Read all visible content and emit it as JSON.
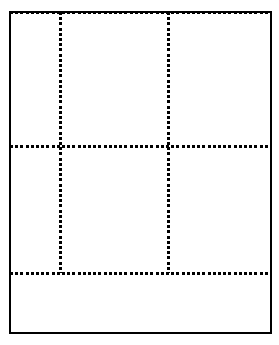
{
  "figure": {
    "kind": "dotted-grid-layout-guide",
    "width": 279,
    "height": 345,
    "background_color": "#ffffff",
    "ink_color": "#000000"
  },
  "frame": {
    "name": "outer-border",
    "style": "solid",
    "left": 9,
    "top": 11,
    "right": 270,
    "bottom": 332,
    "thickness": 2,
    "color": "#000000"
  },
  "dot_style": {
    "shape": "square",
    "size": 3,
    "spacing": 5.2,
    "color": "#000000"
  },
  "grid": {
    "columns": 3,
    "rows": 2,
    "vertical_rules": [
      {
        "name": "vertical-rule-1",
        "x": 59,
        "y_start": 12,
        "y_end": 273
      },
      {
        "name": "vertical-rule-2",
        "x": 167,
        "y_start": 12,
        "y_end": 273
      }
    ],
    "horizontal_rules": [
      {
        "name": "horizontal-rule-top-edge",
        "y": 11,
        "x_start": 10,
        "x_end": 270
      },
      {
        "name": "horizontal-rule-1",
        "y": 145,
        "x_start": 10,
        "x_end": 270
      },
      {
        "name": "horizontal-rule-2",
        "y": 272,
        "x_start": 10,
        "x_end": 270
      }
    ],
    "cells": [
      {
        "name": "cell-r1c1",
        "row": 1,
        "col": 1,
        "left": 11,
        "top": 14,
        "width": 48,
        "height": 131
      },
      {
        "name": "cell-r1c2",
        "row": 1,
        "col": 2,
        "left": 62,
        "top": 14,
        "width": 105,
        "height": 131
      },
      {
        "name": "cell-r1c3",
        "row": 1,
        "col": 3,
        "left": 170,
        "top": 14,
        "width": 99,
        "height": 131
      },
      {
        "name": "cell-r2c1",
        "row": 2,
        "col": 1,
        "left": 11,
        "top": 148,
        "width": 48,
        "height": 124
      },
      {
        "name": "cell-r2c2",
        "row": 2,
        "col": 2,
        "left": 62,
        "top": 148,
        "width": 105,
        "height": 124
      },
      {
        "name": "cell-r2c3",
        "row": 2,
        "col": 3,
        "left": 170,
        "top": 148,
        "width": 99,
        "height": 124
      }
    ],
    "footer_band": {
      "name": "footer-band",
      "left": 11,
      "top": 275,
      "width": 258,
      "height": 56
    }
  }
}
